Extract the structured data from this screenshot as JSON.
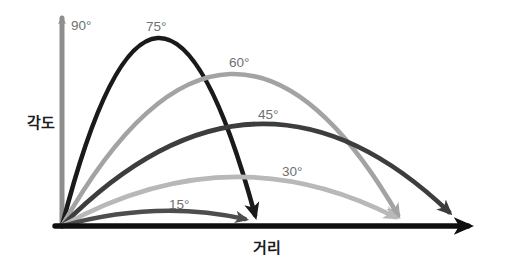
{
  "diagram": {
    "background": "#ffffff",
    "label_color": "#6f6f6f",
    "axis_label_color": "#1c1c1c",
    "y_axis_label": "각도",
    "x_axis": {
      "label": "거리",
      "color": "#0f0f0f",
      "start": [
        55,
        226
      ],
      "end": [
        468,
        226
      ],
      "stroke_width": 5.4,
      "arrow_scale": 3.8
    },
    "trajectories": [
      {
        "label": "90°",
        "type": "line",
        "color": "#8e8e8e",
        "start": [
          62,
          226
        ],
        "end": [
          62,
          18
        ],
        "stroke_width": 5,
        "arrow_scale": 1.8,
        "label_pos": [
          71,
          30
        ]
      },
      {
        "label": "75°",
        "type": "arc",
        "color": "#1a1a1a",
        "start": [
          62,
          226
        ],
        "peak": [
          157,
          38
        ],
        "end": [
          255,
          215
        ],
        "stroke_width": 4.6,
        "arrow_scale": 3.8,
        "label_pos": [
          146,
          31
        ]
      },
      {
        "label": "60°",
        "type": "arc",
        "color": "#a3a3a3",
        "start": [
          62,
          226
        ],
        "peak": [
          231,
          74
        ],
        "end": [
          398,
          215
        ],
        "stroke_width": 4.6,
        "arrow_scale": 3.4,
        "label_pos": [
          229,
          67
        ]
      },
      {
        "label": "45°",
        "type": "arc",
        "color": "#3d3d3d",
        "start": [
          62,
          226
        ],
        "peak": [
          257,
          124
        ],
        "end": [
          449,
          212
        ],
        "stroke_width": 4.6,
        "arrow_scale": 3.4,
        "label_pos": [
          258,
          119
        ]
      },
      {
        "label": "30°",
        "type": "arc",
        "color": "#b8b8b8",
        "start": [
          62,
          226
        ],
        "peak": [
          230,
          177
        ],
        "end": [
          395,
          217
        ],
        "stroke_width": 4.6,
        "arrow_scale": 3.4,
        "label_pos": [
          282,
          176
        ]
      },
      {
        "label": "15°",
        "type": "arc",
        "color": "#4d4d4d",
        "start": [
          62,
          226
        ],
        "peak": [
          156,
          211
        ],
        "end": [
          245,
          219
        ],
        "stroke_width": 4.4,
        "arrow_scale": 3.2,
        "label_pos": [
          169,
          209
        ]
      }
    ]
  }
}
